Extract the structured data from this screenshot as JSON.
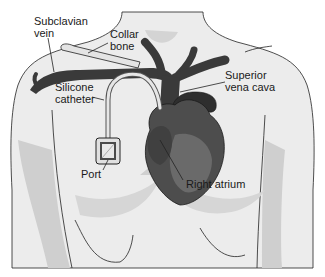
{
  "figure": {
    "type": "anatomical-illustration",
    "labels": {
      "subclavian_vein": "Subclavian\nvein",
      "collar_bone": "Collar\nbone",
      "superior_vena_cava": "Superior\nvena cava",
      "silicone_catheter": "Silicone\ncatheter",
      "port": "Port",
      "right_atrium": "Right atrium"
    },
    "colors": {
      "skin": "#ececec",
      "skin_shadow": "#cfcfcf",
      "vessel": "#3a3a3a",
      "heart": "#4d4d4d",
      "heart_highlight": "#6a6a6a",
      "catheter": "#d8d8d8",
      "outline": "#222222"
    }
  }
}
